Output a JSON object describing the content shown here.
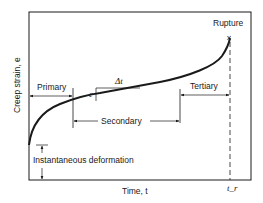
{
  "diagram": {
    "axes": {
      "y_label": "Creep strain, e",
      "x_label": "Time, t",
      "x_marker": "t_r"
    },
    "labels": {
      "rupture": "Rupture",
      "rupture_marker": "×",
      "primary": "Primary",
      "secondary": "Secondary",
      "tertiary": "Tertiary",
      "instantaneous": "Instantaneous deformation",
      "delta_t": "Δt",
      "delta_e": "e"
    },
    "colors": {
      "line": "#1a1a1a",
      "background": "#ffffff"
    }
  }
}
